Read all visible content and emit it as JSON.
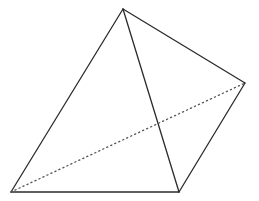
{
  "diagram": {
    "type": "tetrahedron",
    "stroke_color": "#2b2b2b",
    "dotted_color": "#555555",
    "vertices": {
      "apex": [
        123,
        9
      ],
      "right": [
        245,
        83
      ],
      "bottom_left": [
        11,
        192
      ],
      "bottom_right": [
        179,
        192
      ]
    },
    "visible_edges": [
      [
        "apex",
        "bottom_left"
      ],
      [
        "apex",
        "bottom_right"
      ],
      [
        "apex",
        "right"
      ],
      [
        "bottom_left",
        "bottom_right"
      ],
      [
        "bottom_right",
        "right"
      ]
    ],
    "hidden_edges": [
      [
        "bottom_left",
        "right"
      ]
    ]
  }
}
